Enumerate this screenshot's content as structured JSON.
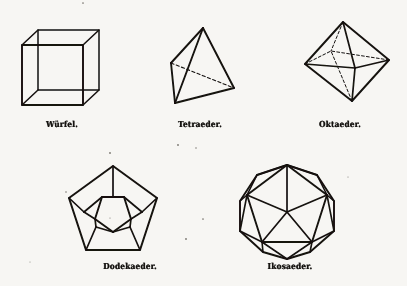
{
  "page": {
    "kind": "scanned-book-plate",
    "background_color": "#f7f6f3",
    "ink_color": "#141210",
    "width": 407,
    "height": 286
  },
  "figures": [
    {
      "id": "wuerfel",
      "caption": "Würfel.",
      "solid": "cube",
      "faces": 6,
      "row": 1,
      "column": 1,
      "hidden_edges_style": "dashed"
    },
    {
      "id": "tetraeder",
      "caption": "Tetraeder.",
      "solid": "tetrahedron",
      "faces": 4,
      "row": 1,
      "column": 2,
      "hidden_edges_style": "dashed"
    },
    {
      "id": "oktaeder",
      "caption": "Oktaeder.",
      "solid": "octahedron",
      "faces": 8,
      "row": 1,
      "column": 3,
      "hidden_edges_style": "dashed"
    },
    {
      "id": "dodekaeder",
      "caption": "Dodekaeder.",
      "solid": "dodecahedron",
      "faces": 12,
      "row": 2,
      "column": 1,
      "hidden_edges_style": "dashed"
    },
    {
      "id": "ikosaeder",
      "caption": "Ikosaeder.",
      "solid": "icosahedron",
      "faces": 20,
      "row": 2,
      "column": 2,
      "hidden_edges_style": "solid"
    }
  ]
}
